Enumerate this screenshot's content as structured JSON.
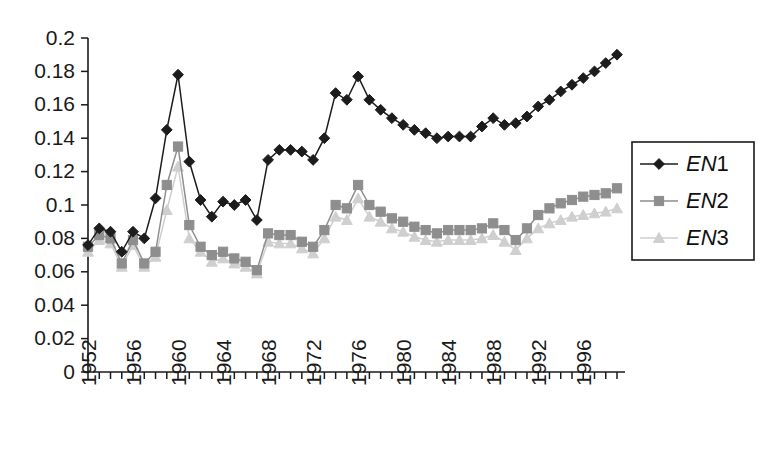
{
  "chart_data": {
    "type": "line",
    "title": "",
    "subtitle": "",
    "xlabel": "",
    "ylabel": "",
    "grid": false,
    "legend_position": "right",
    "ylim": [
      0,
      0.2
    ],
    "ytick_labels": [
      "0.2",
      "0.18",
      "0.16",
      "0.14",
      "0.12",
      "0.1",
      "0.08",
      "0.06",
      "0.04",
      "0.02",
      "0"
    ],
    "ytick_values": [
      0.2,
      0.18,
      0.16,
      0.14,
      0.12,
      0.1,
      0.08,
      0.06,
      0.04,
      0.02,
      0
    ],
    "xtick_labels": [
      "1952",
      "1956",
      "1960",
      "1964",
      "1968",
      "1972",
      "1976",
      "1980",
      "1984",
      "1988",
      "1992",
      "1996"
    ],
    "xtick_values": [
      1952,
      1956,
      1960,
      1964,
      1968,
      1972,
      1976,
      1980,
      1984,
      1988,
      1992,
      1996
    ],
    "x": [
      1952,
      1953,
      1954,
      1955,
      1956,
      1957,
      1958,
      1959,
      1960,
      1961,
      1962,
      1963,
      1964,
      1965,
      1966,
      1967,
      1968,
      1969,
      1970,
      1971,
      1972,
      1973,
      1974,
      1975,
      1976,
      1977,
      1978,
      1979,
      1980,
      1981,
      1982,
      1983,
      1984,
      1985,
      1986,
      1987,
      1988,
      1989,
      1990,
      1991,
      1992,
      1993,
      1994,
      1995,
      1996,
      1997,
      1998,
      1999
    ],
    "series": [
      {
        "name": "EN1",
        "marker": "diamond",
        "color": "#1c1c1c",
        "values": [
          0.076,
          0.086,
          0.084,
          0.072,
          0.084,
          0.08,
          0.104,
          0.145,
          0.178,
          0.126,
          0.103,
          0.093,
          0.102,
          0.1,
          0.103,
          0.091,
          0.127,
          0.133,
          0.133,
          0.132,
          0.127,
          0.14,
          0.167,
          0.163,
          0.177,
          0.163,
          0.157,
          0.152,
          0.148,
          0.145,
          0.143,
          0.14,
          0.141,
          0.141,
          0.141,
          0.147,
          0.152,
          0.148,
          0.149,
          0.153,
          0.159,
          0.163,
          0.168,
          0.172,
          0.176,
          0.18,
          0.185,
          0.19
        ]
      },
      {
        "name": "EN2",
        "marker": "square",
        "color": "#8e8e8e",
        "values": [
          0.075,
          0.082,
          0.08,
          0.065,
          0.079,
          0.065,
          0.072,
          0.112,
          0.135,
          0.088,
          0.075,
          0.07,
          0.072,
          0.068,
          0.066,
          0.061,
          0.083,
          0.082,
          0.082,
          0.078,
          0.075,
          0.085,
          0.1,
          0.098,
          0.112,
          0.1,
          0.096,
          0.092,
          0.09,
          0.087,
          0.085,
          0.083,
          0.085,
          0.085,
          0.085,
          0.086,
          0.089,
          0.085,
          0.079,
          0.086,
          0.094,
          0.098,
          0.101,
          0.103,
          0.105,
          0.106,
          0.107,
          0.11
        ]
      },
      {
        "name": "EN3",
        "marker": "triangle",
        "color": "#cfcfcf",
        "values": [
          0.072,
          0.079,
          0.077,
          0.063,
          0.076,
          0.063,
          0.069,
          0.097,
          0.123,
          0.08,
          0.072,
          0.066,
          0.068,
          0.065,
          0.063,
          0.059,
          0.078,
          0.077,
          0.077,
          0.074,
          0.071,
          0.08,
          0.093,
          0.091,
          0.104,
          0.093,
          0.09,
          0.086,
          0.084,
          0.081,
          0.079,
          0.078,
          0.079,
          0.079,
          0.079,
          0.08,
          0.082,
          0.078,
          0.073,
          0.08,
          0.086,
          0.089,
          0.091,
          0.093,
          0.094,
          0.095,
          0.096,
          0.098
        ]
      }
    ]
  },
  "legend": {
    "entries": [
      {
        "prefix": "EN",
        "suffix": "1",
        "label": "EN1"
      },
      {
        "prefix": "EN",
        "suffix": "2",
        "label": "EN2"
      },
      {
        "prefix": "EN",
        "suffix": "3",
        "label": "EN3"
      }
    ]
  },
  "colors": {
    "series1": "#1c1c1c",
    "series2": "#8e8e8e",
    "series3": "#cfcfcf",
    "axis": "#1a1a1a",
    "background": "#ffffff"
  }
}
